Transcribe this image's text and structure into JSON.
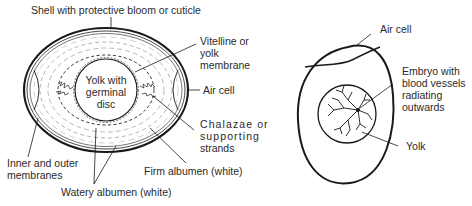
{
  "diagrams": [
    {
      "name": "egg-cross-section",
      "labels": {
        "shell": "Shell with protective bloom or cuticle",
        "vitelline": [
          "Vitelline or",
          "yolk",
          "membrane"
        ],
        "yolk": [
          "Yolk with",
          "germinal",
          "disc"
        ],
        "air_cell": "Air cell",
        "chalazae": [
          "Chalazae or",
          "supporting",
          "strands"
        ],
        "membranes": [
          "Inner and outer",
          "membranes"
        ],
        "firm_albumen": "Firm albumen (white)",
        "watery_albumen": "Watery albumen (white)"
      }
    },
    {
      "name": "fertilised-egg-embryo",
      "labels": {
        "air_cell": "Air cell",
        "embryo": [
          "Embryo with",
          "blood vessels",
          "radiating",
          "outwards"
        ],
        "yolk": "Yolk"
      }
    }
  ],
  "colors": {
    "line": "#1a1a1a",
    "text": "#2a2a2a",
    "background": "#ffffff"
  }
}
